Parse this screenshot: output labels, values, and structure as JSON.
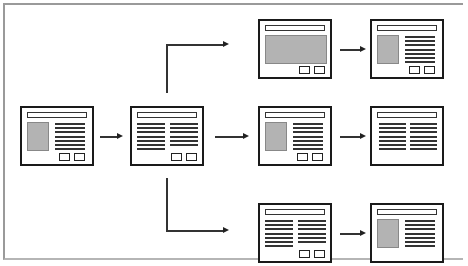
{
  "diagram": {
    "type": "wireframe-flow",
    "colors": {
      "stroke": "#1a1a1a",
      "image_fill": "#b3b3b3",
      "outer_border": "#9a9a9a"
    },
    "frames": [
      {
        "id": "A",
        "layout": "image-left-text-right",
        "text_lines": 7,
        "buttons": 2
      },
      {
        "id": "B",
        "layout": "two-text-columns",
        "text_lines": 7,
        "buttons": 2
      },
      {
        "id": "C1",
        "layout": "full-image",
        "text_lines": 0,
        "buttons": 2
      },
      {
        "id": "D1",
        "layout": "image-left-text-right",
        "text_lines": 7,
        "buttons": 2
      },
      {
        "id": "C2",
        "layout": "image-left-text-right",
        "text_lines": 7,
        "buttons": 2
      },
      {
        "id": "D2",
        "layout": "two-text-columns",
        "text_lines": 7,
        "buttons": 0
      },
      {
        "id": "C3",
        "layout": "two-text-columns",
        "text_lines": 7,
        "buttons": 2
      },
      {
        "id": "D3",
        "layout": "image-left-text-right",
        "text_lines": 7,
        "buttons": 0
      }
    ],
    "edges": [
      {
        "from": "A",
        "to": "B"
      },
      {
        "from": "B",
        "to": "C1",
        "style": "elbow-up"
      },
      {
        "from": "B",
        "to": "C2"
      },
      {
        "from": "B",
        "to": "C3",
        "style": "elbow-down"
      },
      {
        "from": "C1",
        "to": "D1"
      },
      {
        "from": "C2",
        "to": "D2"
      },
      {
        "from": "C3",
        "to": "D3"
      }
    ]
  }
}
